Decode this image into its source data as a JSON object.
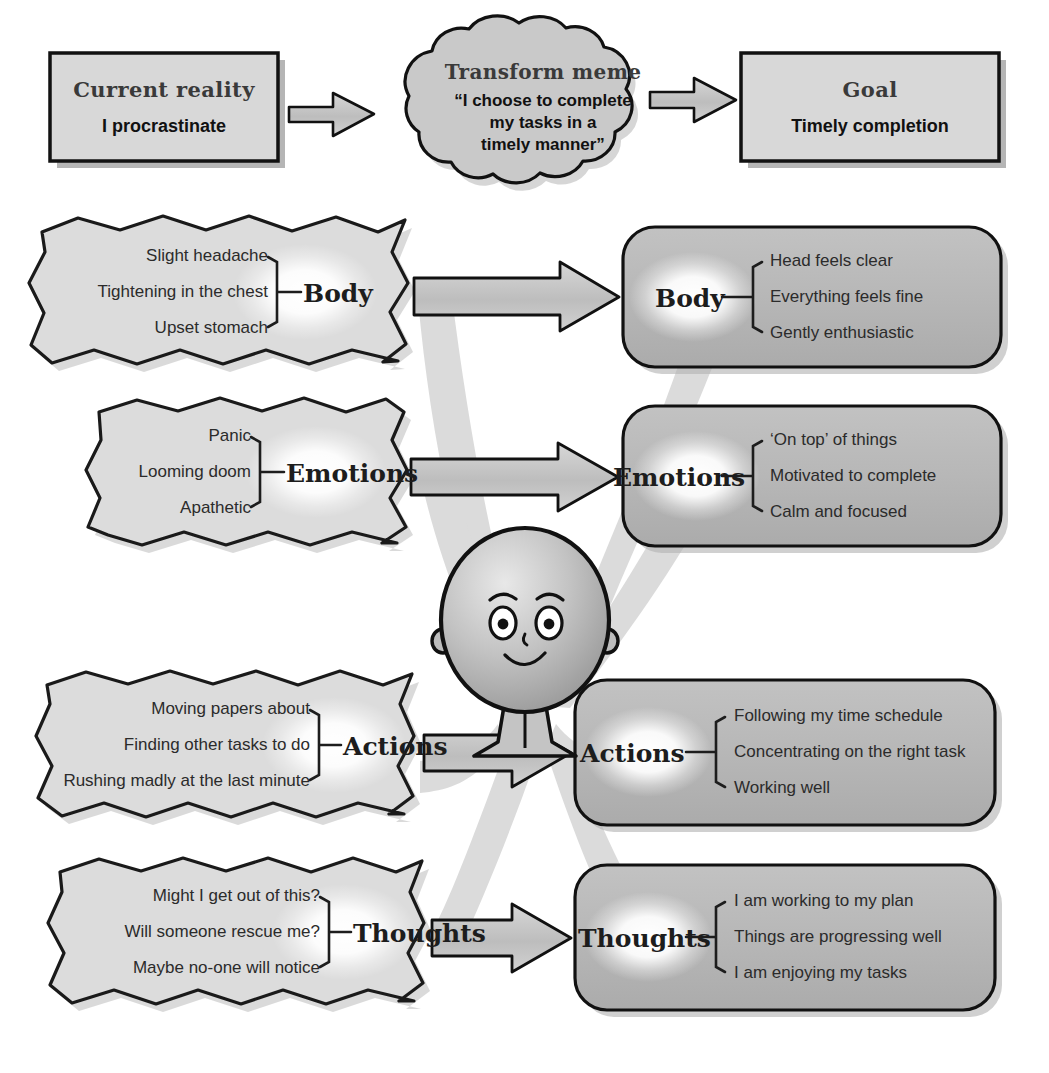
{
  "diagram": {
    "type": "transformation-flow"
  },
  "header": {
    "current": {
      "label": "Current reality",
      "value": "I procrastinate"
    },
    "meme": {
      "label": "Transform meme",
      "quote_line1": "“I choose to complete",
      "quote_line2": "my tasks in a",
      "quote_line3": "timely manner”"
    },
    "goal": {
      "label": "Goal",
      "value": "Timely completion"
    }
  },
  "rows": [
    {
      "key": "body",
      "before": {
        "category": "Body",
        "items": [
          "Slight headache",
          "Tightening in the chest",
          "Upset stomach"
        ]
      },
      "after": {
        "category": "Body",
        "items": [
          "Head feels clear",
          "Everything feels fine",
          "Gently enthusiastic"
        ]
      }
    },
    {
      "key": "emotions",
      "before": {
        "category": "Emotions",
        "items": [
          "Panic",
          "Looming doom",
          "Apathetic"
        ]
      },
      "after": {
        "category": "Emotions",
        "items": [
          "‘On top’ of things",
          "Motivated to complete",
          "Calm and focused"
        ]
      }
    },
    {
      "key": "actions",
      "before": {
        "category": "Actions",
        "items": [
          "Moving papers about",
          "Finding other tasks to do",
          "Rushing madly at the last minute"
        ]
      },
      "after": {
        "category": "Actions",
        "items": [
          "Following my time schedule",
          "Concentrating on the right task",
          "Working well"
        ]
      }
    },
    {
      "key": "thoughts",
      "before": {
        "category": "Thoughts",
        "items": [
          "Might I get out of this?",
          "Will someone rescue me?",
          "Maybe no-one will notice"
        ]
      },
      "after": {
        "category": "Thoughts",
        "items": [
          "I am working to my plan",
          "Things are progressing well",
          "I am enjoying my tasks"
        ]
      }
    }
  ],
  "figure": {
    "name": "person-character"
  },
  "colors": {
    "left_fill": "#dcdcdc",
    "right_fill": "#b9b9b9",
    "header_fill": "#d8d8d8",
    "cloud_fill": "#c9c9c9",
    "outline": "#111111",
    "arrow_fill": "#c6c6c6",
    "swoosh": "#d9d9d9",
    "shadow": "#b5b5b5",
    "glow": "#ffffff",
    "page_bg": "#ffffff"
  }
}
